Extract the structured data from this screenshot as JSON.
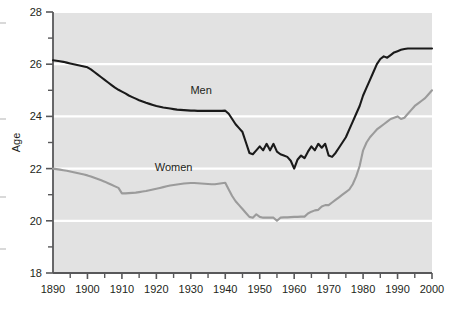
{
  "chart_data": {
    "type": "line",
    "title": "",
    "xlabel": "",
    "ylabel": "Age",
    "xlim": [
      1890,
      2000
    ],
    "ylim": [
      18,
      28
    ],
    "grid": "horizontal-white-gridlines",
    "legend": "inline-series-labels",
    "background_color": "#e2e2e2",
    "gridline_color": "#ffffff",
    "axis_color": "#58585a",
    "x_ticks_major": [
      1890,
      1900,
      1910,
      1920,
      1930,
      1940,
      1950,
      1960,
      1970,
      1980,
      1990,
      2000
    ],
    "x_ticks_minor_step": 5,
    "y_ticks_major": [
      18,
      20,
      22,
      24,
      26,
      28
    ],
    "y_ticks_minor_step": 1,
    "x_tick_labels": [
      "1890",
      "1900",
      "1910",
      "1920",
      "1930",
      "1940",
      "1950",
      "1960",
      "1970",
      "1980",
      "1990",
      "2000"
    ],
    "y_tick_labels": [
      "18",
      "20",
      "22",
      "24",
      "26",
      "28"
    ],
    "series": [
      {
        "name": "Men",
        "color": "#1a1a1a",
        "label_text": "Men",
        "label_x": 1933,
        "label_y": 24.85,
        "x": [
          1890,
          1891,
          1892,
          1893,
          1894,
          1895,
          1896,
          1897,
          1898,
          1899,
          1900,
          1901,
          1902,
          1903,
          1904,
          1905,
          1906,
          1907,
          1908,
          1909,
          1910,
          1911,
          1912,
          1913,
          1914,
          1915,
          1916,
          1917,
          1918,
          1919,
          1920,
          1921,
          1922,
          1923,
          1924,
          1925,
          1926,
          1927,
          1928,
          1929,
          1930,
          1931,
          1932,
          1933,
          1934,
          1935,
          1936,
          1937,
          1938,
          1939,
          1940,
          1941,
          1942,
          1943,
          1944,
          1945,
          1946,
          1947,
          1948,
          1949,
          1950,
          1951,
          1952,
          1953,
          1954,
          1955,
          1956,
          1957,
          1958,
          1959,
          1960,
          1961,
          1962,
          1963,
          1964,
          1965,
          1966,
          1967,
          1968,
          1969,
          1970,
          1971,
          1972,
          1973,
          1974,
          1975,
          1976,
          1977,
          1978,
          1979,
          1980,
          1981,
          1982,
          1983,
          1984,
          1985,
          1986,
          1987,
          1988,
          1989,
          1990,
          1991,
          1992,
          1993,
          1994,
          1995,
          1996,
          1997,
          1998,
          1999,
          2000
        ],
        "y": [
          26.15,
          26.13,
          26.11,
          26.09,
          26.06,
          26.03,
          26.0,
          25.97,
          25.94,
          25.91,
          25.88,
          25.8,
          25.7,
          25.6,
          25.5,
          25.4,
          25.3,
          25.2,
          25.1,
          25.02,
          24.95,
          24.88,
          24.8,
          24.74,
          24.68,
          24.62,
          24.57,
          24.52,
          24.48,
          24.44,
          24.4,
          24.37,
          24.34,
          24.32,
          24.3,
          24.28,
          24.26,
          24.25,
          24.24,
          24.23,
          24.22,
          24.22,
          24.21,
          24.21,
          24.21,
          24.21,
          24.21,
          24.21,
          24.21,
          24.21,
          24.22,
          24.1,
          23.9,
          23.7,
          23.55,
          23.4,
          23.0,
          22.6,
          22.55,
          22.7,
          22.85,
          22.7,
          22.95,
          22.7,
          22.95,
          22.65,
          22.55,
          22.5,
          22.45,
          22.3,
          22.0,
          22.35,
          22.5,
          22.4,
          22.65,
          22.85,
          22.7,
          22.95,
          22.8,
          22.95,
          22.5,
          22.45,
          22.6,
          22.8,
          23.0,
          23.2,
          23.5,
          23.8,
          24.1,
          24.4,
          24.8,
          25.1,
          25.4,
          25.7,
          26.0,
          26.2,
          26.3,
          26.25,
          26.35,
          26.45,
          26.5,
          26.55,
          26.58,
          26.6,
          26.6,
          26.6,
          26.6,
          26.6,
          26.6,
          26.6,
          26.6
        ]
      },
      {
        "name": "Women",
        "color": "#9b9b9b",
        "label_text": "Women",
        "label_x": 1925,
        "label_y": 21.9,
        "x": [
          1890,
          1891,
          1892,
          1893,
          1894,
          1895,
          1896,
          1897,
          1898,
          1899,
          1900,
          1901,
          1902,
          1903,
          1904,
          1905,
          1906,
          1907,
          1908,
          1909,
          1910,
          1911,
          1912,
          1913,
          1914,
          1915,
          1916,
          1917,
          1918,
          1919,
          1920,
          1921,
          1922,
          1923,
          1924,
          1925,
          1926,
          1927,
          1928,
          1929,
          1930,
          1931,
          1932,
          1933,
          1934,
          1935,
          1936,
          1937,
          1938,
          1939,
          1940,
          1941,
          1942,
          1943,
          1944,
          1945,
          1946,
          1947,
          1948,
          1949,
          1950,
          1951,
          1952,
          1953,
          1954,
          1955,
          1956,
          1957,
          1958,
          1959,
          1960,
          1961,
          1962,
          1963,
          1964,
          1965,
          1966,
          1967,
          1968,
          1969,
          1970,
          1971,
          1972,
          1973,
          1974,
          1975,
          1976,
          1977,
          1978,
          1979,
          1980,
          1981,
          1982,
          1983,
          1984,
          1985,
          1986,
          1987,
          1988,
          1989,
          1990,
          1991,
          1992,
          1993,
          1994,
          1995,
          1996,
          1997,
          1998,
          1999,
          2000
        ],
        "y": [
          22.0,
          21.98,
          21.96,
          21.94,
          21.92,
          21.89,
          21.86,
          21.83,
          21.8,
          21.77,
          21.74,
          21.7,
          21.65,
          21.6,
          21.55,
          21.5,
          21.44,
          21.38,
          21.32,
          21.26,
          21.05,
          21.05,
          21.06,
          21.07,
          21.08,
          21.1,
          21.12,
          21.14,
          21.17,
          21.2,
          21.23,
          21.26,
          21.29,
          21.32,
          21.35,
          21.37,
          21.39,
          21.41,
          21.43,
          21.44,
          21.45,
          21.45,
          21.44,
          21.43,
          21.42,
          21.41,
          21.4,
          21.4,
          21.42,
          21.44,
          21.46,
          21.2,
          20.95,
          20.75,
          20.6,
          20.45,
          20.3,
          20.15,
          20.12,
          20.25,
          20.15,
          20.12,
          20.12,
          20.12,
          20.12,
          20.0,
          20.12,
          20.13,
          20.13,
          20.14,
          20.15,
          20.15,
          20.16,
          20.16,
          20.28,
          20.35,
          20.4,
          20.42,
          20.55,
          20.6,
          20.6,
          20.7,
          20.8,
          20.9,
          21.0,
          21.1,
          21.2,
          21.4,
          21.7,
          22.1,
          22.7,
          23.0,
          23.2,
          23.35,
          23.5,
          23.6,
          23.7,
          23.8,
          23.9,
          23.95,
          24.0,
          23.9,
          23.95,
          24.1,
          24.25,
          24.4,
          24.5,
          24.6,
          24.7,
          24.85,
          25.0
        ]
      }
    ]
  }
}
